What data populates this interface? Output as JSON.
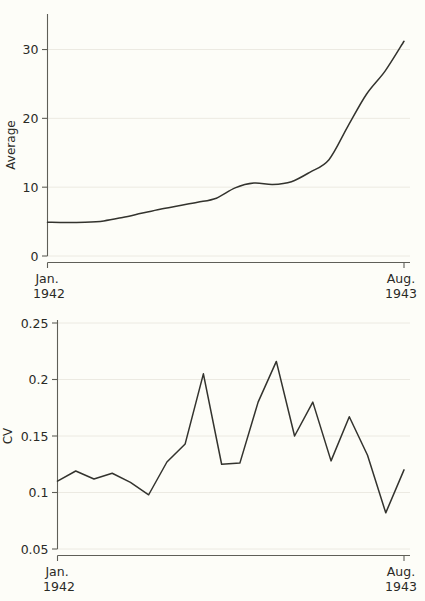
{
  "figure": {
    "background_color": "#fdfdf8",
    "line_color": "#33332e",
    "grid_color": "#eceae2",
    "axis_color": "#5f5f58"
  },
  "chart_data": [
    {
      "type": "line",
      "panel": "top",
      "title": "",
      "xlabel": "",
      "ylabel": "Average",
      "ylim": [
        0,
        34
      ],
      "yticks": [
        0,
        10,
        20,
        30
      ],
      "ytick_labels": [
        "0",
        "10",
        "20",
        "30"
      ],
      "xlim": [
        0,
        19
      ],
      "xticks": [
        0,
        19
      ],
      "xtick_labels": [
        "Jan.\n1942",
        "Aug.\n1943"
      ],
      "xtick_label_lines": [
        [
          "Jan.",
          "1942"
        ],
        [
          "Aug.",
          "1943"
        ]
      ],
      "grid": true,
      "legend": "none",
      "x": [
        0,
        1,
        2,
        3,
        4,
        5,
        6,
        7,
        8,
        9,
        10,
        11,
        12,
        13,
        14,
        15,
        16,
        17,
        18,
        19
      ],
      "values": [
        4.9,
        4.85,
        4.9,
        5.1,
        5.6,
        6.2,
        6.8,
        7.3,
        7.8,
        8.4,
        9.9,
        10.6,
        10.4,
        10.8,
        12.2,
        14.0,
        18.8,
        23.5,
        26.9,
        31.2
      ],
      "series_name": "Average"
    },
    {
      "type": "line",
      "panel": "bottom",
      "title": "",
      "xlabel": "",
      "ylabel": "CV",
      "ylim": [
        0.05,
        0.25
      ],
      "yticks": [
        0.05,
        0.1,
        0.15,
        0.2,
        0.25
      ],
      "ytick_labels": [
        "0.05",
        "0.1",
        "0.15",
        "0.2",
        "0.25"
      ],
      "xlim": [
        0,
        19
      ],
      "xticks": [
        0,
        19
      ],
      "xtick_labels": [
        "Jan.\n1942",
        "Aug.\n1943"
      ],
      "xtick_label_lines": [
        [
          "Jan.",
          "1942"
        ],
        [
          "Aug.",
          "1943"
        ]
      ],
      "grid": true,
      "legend": "none",
      "x": [
        0,
        1,
        2,
        3,
        4,
        5,
        6,
        7,
        8,
        9,
        10,
        11,
        12,
        13,
        14,
        15,
        16,
        17,
        18,
        19
      ],
      "values": [
        0.11,
        0.119,
        0.112,
        0.117,
        0.109,
        0.098,
        0.127,
        0.143,
        0.205,
        0.125,
        0.126,
        0.18,
        0.216,
        0.15,
        0.18,
        0.128,
        0.167,
        0.133,
        0.082,
        0.12
      ],
      "series_name": "CV"
    }
  ],
  "panels": {
    "average": {
      "ylabel": "Average",
      "ytick_labels": [
        "30",
        "20",
        "10",
        "0"
      ],
      "xtick_left_line1": "Jan.",
      "xtick_left_line2": "1942",
      "xtick_right_line1": "Aug.",
      "xtick_right_line2": "1943"
    },
    "cv": {
      "ylabel": "CV",
      "ytick_labels": [
        "0.25",
        "0.2",
        "0.15",
        "0.1",
        "0.05"
      ],
      "xtick_left_line1": "Jan.",
      "xtick_left_line2": "1942",
      "xtick_right_line1": "Aug.",
      "xtick_right_line2": "1943"
    }
  }
}
